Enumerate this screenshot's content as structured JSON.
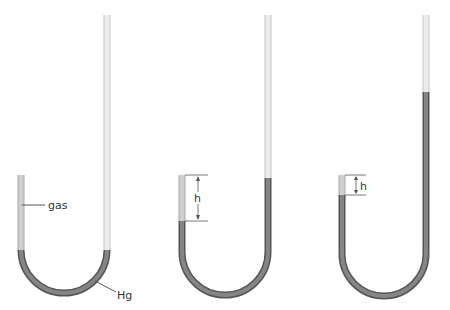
{
  "labels": {
    "gas": "gas",
    "mercury": "Hg",
    "height_1": "h",
    "height_2": "h"
  },
  "colors": {
    "glass": "#e6e6e6",
    "glass_edge": "#c4c4c4",
    "gas": "#c9c9c9",
    "mercury": "#7d7d7d",
    "mercury_edge": "#555555",
    "leader": "#555555"
  },
  "tubes": [
    {
      "id": "tube-1",
      "left_x": 21,
      "right_x": 107,
      "left_top": 175,
      "right_top": 15,
      "hg_left": 250,
      "hg_right": 250
    },
    {
      "id": "tube-2",
      "left_x": 182,
      "right_x": 268,
      "left_top": 175,
      "right_top": 15,
      "hg_left": 221,
      "hg_right": 178
    },
    {
      "id": "tube-3",
      "left_x": 342,
      "right_x": 426,
      "left_top": 175,
      "right_top": 15,
      "hg_left": 195,
      "hg_right": 92
    }
  ]
}
